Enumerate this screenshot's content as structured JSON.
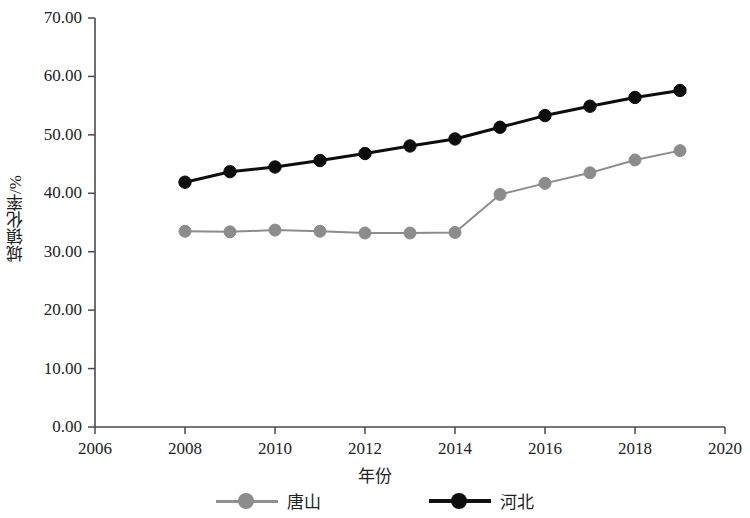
{
  "chart_data": {
    "type": "line",
    "title": "",
    "xlabel": "年份",
    "ylabel": "城镇化率/%",
    "x": [
      2008,
      2009,
      2010,
      2011,
      2012,
      2013,
      2014,
      2015,
      2016,
      2017,
      2018,
      2019
    ],
    "xlim": [
      2006,
      2020
    ],
    "ylim": [
      0,
      70
    ],
    "xticks": [
      "2006",
      "2008",
      "2010",
      "2012",
      "2014",
      "2016",
      "2018",
      "2020"
    ],
    "xtick_values": [
      2006,
      2008,
      2010,
      2012,
      2014,
      2016,
      2018,
      2020
    ],
    "yticks": [
      "0.00",
      "10.00",
      "20.00",
      "30.00",
      "40.00",
      "50.00",
      "60.00",
      "70.00"
    ],
    "ytick_values": [
      0,
      10,
      20,
      30,
      40,
      50,
      60,
      70
    ],
    "grid": false,
    "legend_position": "bottom",
    "series": [
      {
        "name": "唐山",
        "color": "#8c8c8c",
        "values": [
          33.5,
          33.4,
          33.7,
          33.5,
          33.2,
          33.2,
          33.3,
          39.8,
          41.7,
          43.5,
          45.7,
          47.3
        ]
      },
      {
        "name": "河北",
        "color": "#0d0d0d",
        "values": [
          41.9,
          43.7,
          44.5,
          45.6,
          46.8,
          48.1,
          49.3,
          51.3,
          53.3,
          54.9,
          56.4,
          57.6
        ]
      }
    ]
  },
  "legend": {
    "items": [
      {
        "label": "唐山"
      },
      {
        "label": "河北"
      }
    ]
  },
  "axes": {
    "x_axis_label": "年份",
    "y_axis_label": "城镇化率/%"
  }
}
